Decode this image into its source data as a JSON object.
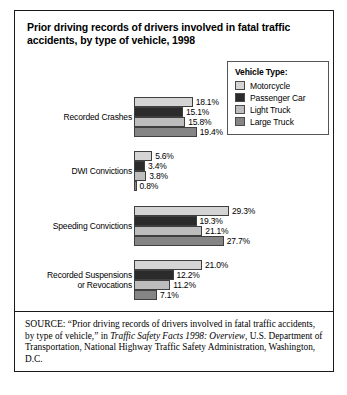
{
  "title": "Prior driving records of drivers involved in fatal traffic accidents, by type of vehicle, 1998",
  "legend": {
    "title": "Vehicle Type:",
    "items": [
      {
        "label": "Motorcycle",
        "color": "#d4d4d4"
      },
      {
        "label": "Passenger Car",
        "color": "#2b2b2b"
      },
      {
        "label": "Light Truck",
        "color": "#bdbdbd"
      },
      {
        "label": "Large Truck",
        "color": "#858585"
      }
    ]
  },
  "source": {
    "prefix": "SOURCE:",
    "part1": " “Prior driving records of drivers involved in fatal traffic accidents, by type of vehicle,” in ",
    "italic": "Traffic Safety Facts 1998: Overview",
    "part2": ", U.S. Department of Transportation, National Highway Traffic Safety Administration, Washington, D.C."
  },
  "chart_data": {
    "type": "bar",
    "orientation": "horizontal",
    "title": "Prior driving records of drivers involved in fatal traffic accidents, by type of vehicle, 1998",
    "xlabel": "",
    "ylabel": "",
    "xlim": [
      0,
      30
    ],
    "grid": false,
    "legend_position": "top-right",
    "categories": [
      "Recorded Crashes",
      "DWI Convictions",
      "Speeding Convictions",
      "Recorded Suspensions or Revocations"
    ],
    "series": [
      {
        "name": "Motorcycle",
        "color": "#d4d4d4",
        "values": [
          18.1,
          5.6,
          29.3,
          21.0
        ],
        "labels": [
          "18.1%",
          "5.6%",
          "29.3%",
          "21.0%"
        ]
      },
      {
        "name": "Passenger Car",
        "color": "#2b2b2b",
        "values": [
          15.1,
          3.4,
          19.3,
          12.2
        ],
        "labels": [
          "15.1%",
          "3.4%",
          "19.3%",
          "12.2%"
        ]
      },
      {
        "name": "Light Truck",
        "color": "#bdbdbd",
        "values": [
          15.8,
          3.8,
          21.1,
          11.2
        ],
        "labels": [
          "15.8%",
          "3.8%",
          "21.1%",
          "11.2%"
        ]
      },
      {
        "name": "Large Truck",
        "color": "#858585",
        "values": [
          19.4,
          0.8,
          27.7,
          7.1
        ],
        "labels": [
          "19.4%",
          "0.8%",
          "27.7%",
          "7.1%"
        ]
      }
    ]
  },
  "category_lines": [
    [
      "Recorded Crashes"
    ],
    [
      "DWI Convictions"
    ],
    [
      "Speeding Convictions"
    ],
    [
      "Recorded Suspensions",
      "or Revocations"
    ]
  ]
}
